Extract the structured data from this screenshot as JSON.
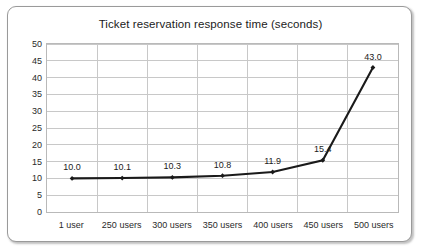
{
  "chart_data": {
    "type": "line",
    "title": "Ticket reservation response time (seconds)",
    "xlabel": "",
    "ylabel": "",
    "categories": [
      "1 user",
      "250 users",
      "300 users",
      "350 users",
      "400 users",
      "450 users",
      "500 users"
    ],
    "values": [
      10.0,
      10.1,
      10.3,
      10.8,
      11.9,
      15.4,
      43.0
    ],
    "point_labels": [
      "10.0",
      "10.1",
      "10.3",
      "10.8",
      "11.9",
      "15.4",
      "43.0"
    ],
    "ylim": [
      0,
      50
    ],
    "ytick_step": 5,
    "ytick_labels": [
      "50",
      "45",
      "40",
      "35",
      "30",
      "25",
      "20",
      "15",
      "10",
      "5",
      "0"
    ],
    "grid": true,
    "legend": false,
    "legend_position": "none",
    "series": [
      {
        "name": "Response time",
        "values": [
          10.0,
          10.1,
          10.3,
          10.8,
          11.9,
          15.4,
          43.0
        ],
        "color": "#1a1a1a",
        "marker": "diamond"
      }
    ],
    "colors": {
      "line": "#1a1a1a",
      "marker": "#1a1a1a",
      "grid": "#c8c8c8",
      "plot_border": "#b9b9b9",
      "frame_border": "#9a9a9a",
      "background": "#ffffff",
      "text": "#1b1b1b"
    }
  }
}
